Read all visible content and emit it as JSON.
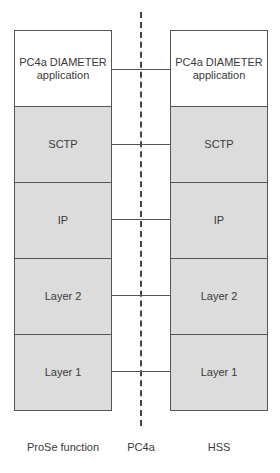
{
  "diagram": {
    "left_entity": {
      "name": "ProSe function",
      "layers": [
        "PC4a DIAMETER\napplication",
        "SCTP",
        "IP",
        "Layer 2",
        "Layer 1"
      ]
    },
    "right_entity": {
      "name": "HSS",
      "layers": [
        "PC4a DIAMETER\napplication",
        "SCTP",
        "IP",
        "Layer 2",
        "Layer 1"
      ]
    },
    "interface": {
      "name": "PC4a"
    },
    "colors": {
      "app_layer": "#ffffff",
      "lower_layers": "#dcdcdc",
      "lines": "#555555"
    }
  }
}
